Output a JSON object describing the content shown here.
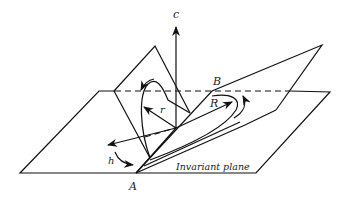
{
  "figure": {
    "labels": {
      "c": "c",
      "B": "B",
      "r": "r",
      "R": "R",
      "h": "h",
      "A": "A",
      "invariant_plane": "Invariant plane"
    },
    "colors": {
      "stroke": "#111111",
      "background": "#ffffff",
      "text": "#222222"
    }
  }
}
